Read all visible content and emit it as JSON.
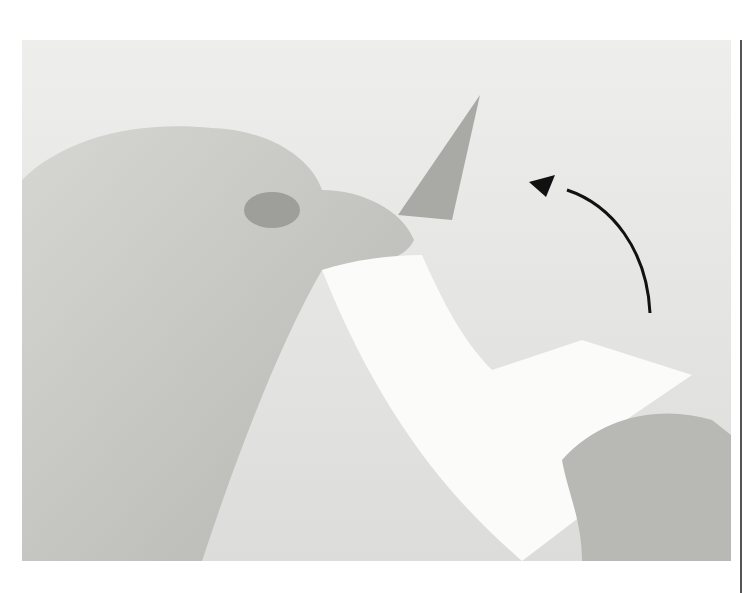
{
  "figure": {
    "arrow": {
      "direction": "up-left",
      "color": "#111111"
    },
    "colors": {
      "background": "#ececea",
      "paper": "#fbfbfa",
      "skin": "#c9c9c6",
      "rule": "#555555"
    }
  }
}
